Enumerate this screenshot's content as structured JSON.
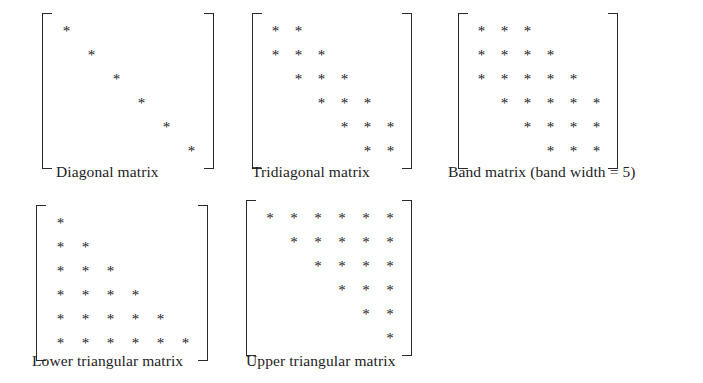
{
  "figure": {
    "background_color": "#ffffff",
    "ink_color": "#232323",
    "star_glyph": "*",
    "matrix_order": 6
  },
  "matrices": [
    {
      "id": "diagonal",
      "caption": "Diagonal matrix",
      "rows": 6,
      "cols": 6,
      "cell_width": 25,
      "cell_height": 24,
      "star_size": 15,
      "pattern": [
        [
          1,
          0,
          0,
          0,
          0,
          0
        ],
        [
          0,
          1,
          0,
          0,
          0,
          0
        ],
        [
          0,
          0,
          1,
          0,
          0,
          0
        ],
        [
          0,
          0,
          0,
          1,
          0,
          0
        ],
        [
          0,
          0,
          0,
          0,
          1,
          0
        ],
        [
          0,
          0,
          0,
          0,
          0,
          1
        ]
      ]
    },
    {
      "id": "tridiagonal",
      "caption": "Tridiagonal matrix",
      "rows": 6,
      "cols": 6,
      "cell_width": 23,
      "cell_height": 24,
      "star_size": 15,
      "pattern": [
        [
          1,
          1,
          0,
          0,
          0,
          0
        ],
        [
          1,
          1,
          1,
          0,
          0,
          0
        ],
        [
          0,
          1,
          1,
          1,
          0,
          0
        ],
        [
          0,
          0,
          1,
          1,
          1,
          0
        ],
        [
          0,
          0,
          0,
          1,
          1,
          1
        ],
        [
          0,
          0,
          0,
          0,
          1,
          1
        ]
      ]
    },
    {
      "id": "band",
      "caption": "Band matrix (band width = 5)",
      "rows": 6,
      "cols": 6,
      "cell_width": 23,
      "cell_height": 24,
      "star_size": 15,
      "pattern": [
        [
          1,
          1,
          1,
          0,
          0,
          0
        ],
        [
          1,
          1,
          1,
          1,
          0,
          0
        ],
        [
          1,
          1,
          1,
          1,
          1,
          0
        ],
        [
          0,
          1,
          1,
          1,
          1,
          1
        ],
        [
          0,
          0,
          1,
          1,
          1,
          1
        ],
        [
          0,
          0,
          0,
          1,
          1,
          1
        ]
      ]
    },
    {
      "id": "lower",
      "caption": "Lower triangular matrix",
      "rows": 6,
      "cols": 6,
      "cell_width": 25,
      "cell_height": 24,
      "star_size": 15,
      "pattern": [
        [
          1,
          0,
          0,
          0,
          0,
          0
        ],
        [
          1,
          1,
          0,
          0,
          0,
          0
        ],
        [
          1,
          1,
          1,
          0,
          0,
          0
        ],
        [
          1,
          1,
          1,
          1,
          0,
          0
        ],
        [
          1,
          1,
          1,
          1,
          1,
          0
        ],
        [
          1,
          1,
          1,
          1,
          1,
          1
        ]
      ]
    },
    {
      "id": "upper",
      "caption": "Upper triangular matrix",
      "rows": 6,
      "cols": 6,
      "cell_width": 24,
      "cell_height": 24,
      "star_size": 15,
      "pattern": [
        [
          1,
          1,
          1,
          1,
          1,
          1
        ],
        [
          0,
          1,
          1,
          1,
          1,
          1
        ],
        [
          0,
          0,
          1,
          1,
          1,
          1
        ],
        [
          0,
          0,
          0,
          1,
          1,
          1
        ],
        [
          0,
          0,
          0,
          0,
          1,
          1
        ],
        [
          0,
          0,
          0,
          0,
          0,
          1
        ]
      ]
    }
  ]
}
